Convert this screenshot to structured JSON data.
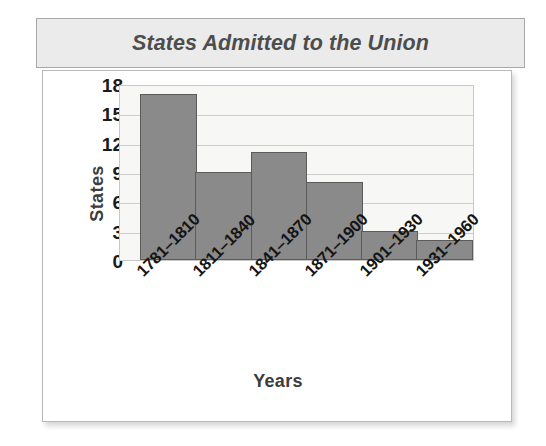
{
  "chart_data": {
    "type": "bar",
    "title": "States Admitted to the Union",
    "xlabel": "Years",
    "ylabel": "States",
    "categories": [
      "1781–1810",
      "1811–1840",
      "1841–1870",
      "1871–1900",
      "1901–1930",
      "1931–1960"
    ],
    "values": [
      17,
      9,
      11,
      8,
      3,
      2
    ],
    "yticks": [
      0,
      3,
      6,
      9,
      12,
      15,
      18
    ],
    "ylim": [
      0,
      18
    ],
    "grid": true,
    "legend": false,
    "bar_color": "#8a8a8a",
    "bar_edge_color": "#5b5b5b",
    "plot_background": "#f7f7f5",
    "title_color": "#4d4d4d",
    "title_background": "#ebebeb"
  }
}
